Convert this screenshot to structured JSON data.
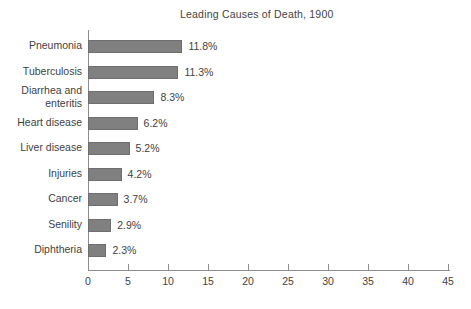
{
  "chart_data": {
    "type": "bar",
    "orientation": "horizontal",
    "title": "Leading Causes of Death, 1900",
    "xlabel": "",
    "ylabel": "",
    "xlim": [
      0,
      45
    ],
    "xticks": [
      0,
      5,
      10,
      15,
      20,
      25,
      30,
      35,
      40,
      45
    ],
    "grid": false,
    "legend": null,
    "bar_color": "#808080",
    "bar_border_color": "#6e6e6e",
    "background_color": "#ffffff",
    "text_color": "#3f3f3f",
    "axis_color": "#8c8c8c",
    "categories": [
      "Pneumonia",
      "Tuberculosis",
      "Diarrhea and\nenteritis",
      "Heart disease",
      "Liver disease",
      "Injuries",
      "Cancer",
      "Senility",
      "Diphtheria"
    ],
    "values": [
      11.8,
      11.3,
      8.3,
      6.2,
      5.2,
      4.2,
      3.7,
      2.9,
      2.3
    ],
    "value_labels": [
      "11.8%",
      "11.3%",
      "8.3%",
      "6.2%",
      "5.2%",
      "4.2%",
      "3.7%",
      "2.9%",
      "2.3%"
    ],
    "tick_labels": [
      "0",
      "5",
      "10",
      "15",
      "20",
      "25",
      "30",
      "35",
      "40",
      "45"
    ]
  }
}
